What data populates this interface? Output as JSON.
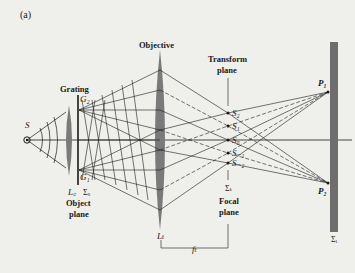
{
  "figure_label": "(a)",
  "labels": {
    "source": "S",
    "grating": "Grating",
    "g2": "G₂",
    "g1": "G₁",
    "condenser": "L꜀",
    "sigma_o": "Σₒ",
    "object_plane_1": "Object",
    "object_plane_2": "plane",
    "objective": "Objective",
    "objective_lens": "Lₜ",
    "transform_plane_1": "Transform",
    "transform_plane_2": "plane",
    "s2": "S₂",
    "s1": "S₁",
    "s0": "S₀",
    "sm1": "S₋₁",
    "sm2": "S₋₂",
    "sigma_t": "Σₜ",
    "focal_plane_1": "Focal",
    "focal_plane_2": "plane",
    "focal_length": "fₜ",
    "p1": "P₁",
    "p2": "P₂",
    "sigma_i": "Σᵢ"
  },
  "colors": {
    "background": "#efefeb",
    "ink": "#1a1a1a",
    "lens": "#7a7a7a",
    "screen": "#6e6e6e"
  }
}
